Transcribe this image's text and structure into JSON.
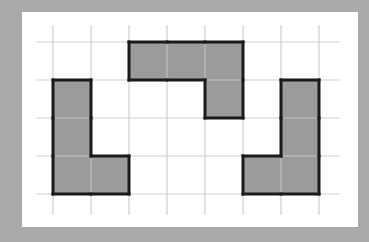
{
  "diagram": {
    "type": "grid-polyomino",
    "background_color": "#a9a9a9",
    "panel_color": "#ffffff",
    "grid_line_color": "#cfcfcf",
    "shape_fill": "#9b9b9b",
    "shape_stroke": "#1a1a1a",
    "grid": {
      "columns": 7,
      "rows": 4,
      "cell_size": 38,
      "origin_x": 53,
      "origin_y": 42
    },
    "shapes": [
      {
        "name": "left-l-shape",
        "cells": [
          [
            0,
            1
          ],
          [
            0,
            2
          ],
          [
            0,
            3
          ],
          [
            1,
            3
          ]
        ]
      },
      {
        "name": "top-l-shape",
        "cells": [
          [
            2,
            0
          ],
          [
            3,
            0
          ],
          [
            4,
            0
          ],
          [
            4,
            1
          ]
        ]
      },
      {
        "name": "right-l-shape",
        "cells": [
          [
            6,
            1
          ],
          [
            6,
            2
          ],
          [
            6,
            3
          ],
          [
            5,
            3
          ]
        ]
      }
    ]
  }
}
